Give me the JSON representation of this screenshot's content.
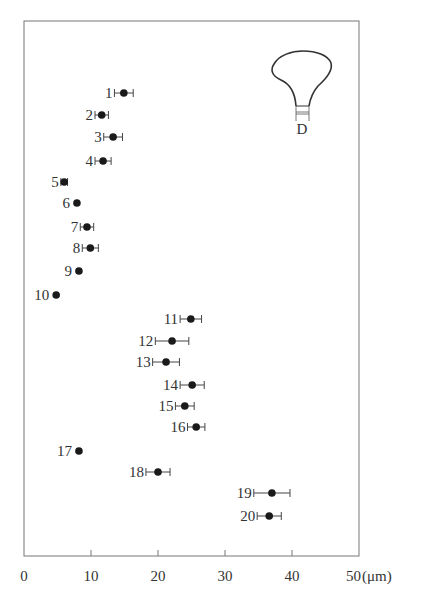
{
  "chart_data": {
    "type": "scatter",
    "title": "",
    "xlabel": "(μm)",
    "ylabel": "",
    "xlim": [
      0,
      50
    ],
    "x_ticks": [
      0,
      10,
      20,
      30,
      40,
      50
    ],
    "x_tick_labels": [
      "0",
      "10",
      "20",
      "30",
      "40",
      "50"
    ],
    "unit_label": "(μm)",
    "grid": false,
    "legend": null,
    "inset": {
      "shape": "bulb-cell-outline",
      "label": "D"
    },
    "points": [
      {
        "id": "1",
        "value": 14.9,
        "error": 1.4,
        "y_px": 93
      },
      {
        "id": "2",
        "value": 11.6,
        "error": 1.0,
        "y_px": 115
      },
      {
        "id": "3",
        "value": 13.3,
        "error": 1.4,
        "y_px": 137
      },
      {
        "id": "4",
        "value": 11.8,
        "error": 1.2,
        "y_px": 161
      },
      {
        "id": "5",
        "value": 6.0,
        "error": 0.5,
        "y_px": 182
      },
      {
        "id": "6",
        "value": 7.9,
        "error": 0,
        "y_px": 203
      },
      {
        "id": "7",
        "value": 9.4,
        "error": 1.0,
        "y_px": 227
      },
      {
        "id": "8",
        "value": 9.9,
        "error": 1.2,
        "y_px": 248
      },
      {
        "id": "9",
        "value": 8.2,
        "error": 0,
        "y_px": 271
      },
      {
        "id": "10",
        "value": 4.8,
        "error": 0,
        "y_px": 295
      },
      {
        "id": "11",
        "value": 24.9,
        "error": 1.6,
        "y_px": 319
      },
      {
        "id": "12",
        "value": 22.1,
        "error": 2.5,
        "y_px": 341
      },
      {
        "id": "13",
        "value": 21.2,
        "error": 2.0,
        "y_px": 362
      },
      {
        "id": "14",
        "value": 25.1,
        "error": 1.8,
        "y_px": 385
      },
      {
        "id": "15",
        "value": 24.0,
        "error": 1.4,
        "y_px": 406
      },
      {
        "id": "16",
        "value": 25.7,
        "error": 1.3,
        "y_px": 427
      },
      {
        "id": "17",
        "value": 8.2,
        "error": 0,
        "y_px": 451
      },
      {
        "id": "18",
        "value": 20.0,
        "error": 1.8,
        "y_px": 472
      },
      {
        "id": "19",
        "value": 37.0,
        "error": 2.7,
        "y_px": 493
      },
      {
        "id": "20",
        "value": 36.6,
        "error": 1.8,
        "y_px": 516
      }
    ]
  },
  "colors": {
    "frame": "#777777",
    "marker": "#1a1a1a",
    "text": "#333333"
  }
}
